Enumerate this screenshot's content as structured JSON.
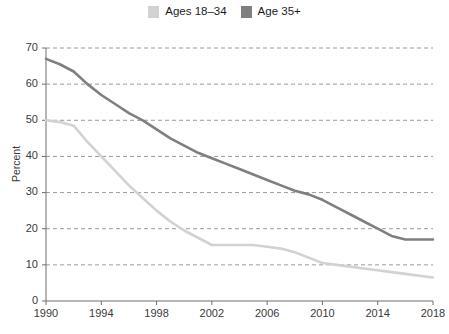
{
  "legend": {
    "position": "top-center",
    "entries": [
      {
        "label": "Ages 18–34",
        "color": "#d2d2d2",
        "name": "ages-18-34"
      },
      {
        "label": "Age 35+",
        "color": "#7f7f7f",
        "name": "age-35-plus"
      }
    ]
  },
  "axis": {
    "ylabel": "Percent",
    "yticks": [
      "0",
      "10",
      "20",
      "30",
      "40",
      "50",
      "60",
      "70"
    ],
    "xticks": [
      "1990",
      "1994",
      "1998",
      "2002",
      "2006",
      "2010",
      "2014",
      "2018"
    ]
  },
  "chart_data": {
    "type": "line",
    "title": "",
    "xlabel": "",
    "ylabel": "Percent",
    "xlim": [
      1990,
      2018
    ],
    "ylim": [
      0,
      70
    ],
    "grid": true,
    "legend_position": "top-center",
    "x": [
      1990,
      1991,
      1992,
      1993,
      1994,
      1995,
      1996,
      1997,
      1998,
      1999,
      2000,
      2001,
      2002,
      2003,
      2004,
      2005,
      2006,
      2007,
      2008,
      2009,
      2010,
      2011,
      2012,
      2013,
      2014,
      2015,
      2016,
      2017,
      2018
    ],
    "series": [
      {
        "name": "Ages 18–34",
        "color": "#d2d2d2",
        "values": [
          50,
          49.5,
          48.5,
          44,
          40,
          36,
          32,
          28.5,
          25,
          22,
          19.5,
          17.5,
          15.5,
          15.5,
          15.5,
          15.5,
          15,
          14.5,
          13.5,
          12,
          10.5,
          10,
          9.5,
          9,
          8.5,
          8,
          7.5,
          7,
          6.5
        ]
      },
      {
        "name": "Age 35+",
        "color": "#7f7f7f",
        "values": [
          67,
          65.5,
          63.5,
          60,
          57,
          54.5,
          52,
          50,
          47.5,
          45,
          43,
          41,
          39.5,
          38,
          36.5,
          35,
          33.5,
          32,
          30.5,
          29.5,
          28,
          26,
          24,
          22,
          20,
          18,
          17,
          17,
          17
        ]
      }
    ]
  }
}
